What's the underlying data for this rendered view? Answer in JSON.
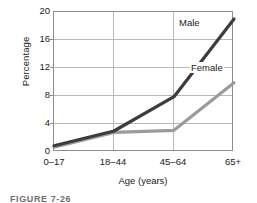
{
  "chart_data": {
    "type": "line",
    "title": "",
    "subtitle": "",
    "xlabel": "Age (years)",
    "ylabel": "Percentage",
    "categories": [
      "0–17",
      "18–44",
      "45–64",
      "65+"
    ],
    "series": [
      {
        "name": "Male",
        "values": [
          0.9,
          3.0,
          7.9,
          19.0
        ],
        "color": "#3c3c3c"
      },
      {
        "name": "Female",
        "values": [
          0.7,
          2.8,
          3.1,
          9.9
        ],
        "color": "#9b9b9b"
      }
    ],
    "ylim": [
      0,
      20
    ],
    "yticks": [
      0,
      4,
      8,
      12,
      16,
      20
    ],
    "ytick_labels": [
      "0",
      "4",
      "8",
      "12",
      "16",
      "20"
    ],
    "grid": true,
    "grid_axis": "both",
    "legend": "inline-series-labels",
    "legend_position": "inside-right"
  },
  "axes": {
    "y_title": "Percentage",
    "x_title": "Age (years)",
    "y_tick_labels": [
      "20",
      "16",
      "12",
      "8",
      "4",
      "0"
    ],
    "x_tick_labels": [
      "0–17",
      "18–44",
      "45–64",
      "65+"
    ]
  },
  "labels": {
    "male": "Male",
    "female": "Female"
  },
  "caption": {
    "text": "FIGURE 7-26"
  },
  "colors": {
    "male_line": "#3c3c3c",
    "female_line": "#9b9b9b",
    "grid": "#b9b9b9",
    "frame": "#8d8d8d",
    "text": "#1a1a1a",
    "background": "#ffffff"
  }
}
